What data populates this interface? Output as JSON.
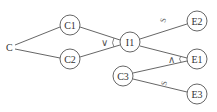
{
  "diagram": {
    "nodes": [
      {
        "id": "C",
        "label": "C",
        "x": 10,
        "y": 47,
        "circled": false
      },
      {
        "id": "C1",
        "label": "C1",
        "x": 70,
        "y": 25,
        "circled": true
      },
      {
        "id": "C2",
        "label": "C2",
        "x": 70,
        "y": 59,
        "circled": true
      },
      {
        "id": "I1",
        "label": "I1",
        "x": 130,
        "y": 42,
        "circled": true
      },
      {
        "id": "E2",
        "label": "E2",
        "x": 197,
        "y": 21,
        "circled": true
      },
      {
        "id": "E1",
        "label": "E1",
        "x": 197,
        "y": 59,
        "circled": true
      },
      {
        "id": "C3",
        "label": "C3",
        "x": 123,
        "y": 76,
        "circled": true
      },
      {
        "id": "E3",
        "label": "E3",
        "x": 197,
        "y": 94,
        "circled": true
      }
    ],
    "edges": [
      {
        "from": "C",
        "to": "C1"
      },
      {
        "from": "C",
        "to": "C2"
      },
      {
        "from": "C1",
        "to": "I1"
      },
      {
        "from": "C2",
        "to": "I1"
      },
      {
        "from": "I1",
        "to": "E2",
        "label": "S"
      },
      {
        "from": "I1",
        "to": "E1"
      },
      {
        "from": "C3",
        "to": "E1"
      },
      {
        "from": "C3",
        "to": "E3",
        "label": "S"
      }
    ],
    "junctions": [
      {
        "at": "I1",
        "symbol": "∨",
        "meaning": "OR"
      },
      {
        "at": "E1",
        "symbol": "∧",
        "meaning": "AND"
      }
    ],
    "edge_labels": {
      "i1_e2": "S",
      "c3_e3": "S"
    }
  }
}
